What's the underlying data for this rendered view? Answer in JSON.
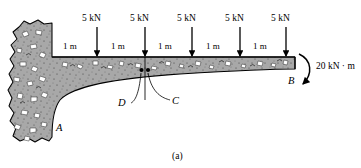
{
  "figure": {
    "caption": "(a)",
    "type": "tapered-cantilever-beam-free-body-diagram"
  },
  "beam": {
    "fixed_support_label": "A",
    "free_end_label": "B",
    "section_points": [
      {
        "name": "D",
        "label": "D"
      },
      {
        "name": "C",
        "label": "C"
      }
    ]
  },
  "loads": [
    {
      "label": "5 kN",
      "x": 97
    },
    {
      "label": "5 kN",
      "x": 145
    },
    {
      "label": "5 kN",
      "x": 192
    },
    {
      "label": "5 kN",
      "x": 240
    },
    {
      "label": "5 kN",
      "x": 286
    }
  ],
  "dimensions": [
    {
      "label": "1 m",
      "x": 74
    },
    {
      "label": "1 m",
      "x": 121
    },
    {
      "label": "1 m",
      "x": 168
    },
    {
      "label": "1 m",
      "x": 216
    },
    {
      "label": "1 m",
      "x": 263
    }
  ],
  "moment": {
    "label": "20 kN · m",
    "sense": "clockwise"
  },
  "colors": {
    "concrete_fill": "#a8a8a8",
    "aggregate": "#ffffff",
    "outline": "#000000",
    "beam_edge": "#1a1a1a"
  }
}
